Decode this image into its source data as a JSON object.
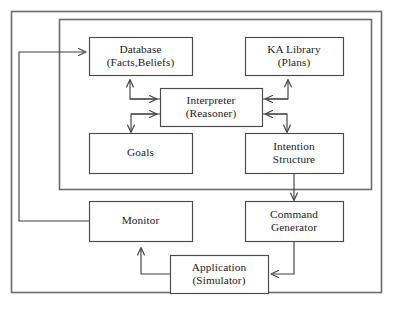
{
  "diagram": {
    "type": "block-diagram",
    "canvas": {
      "width": 394,
      "height": 312,
      "background": "#ffffff"
    },
    "colors": {
      "frame_stroke": "#6b6b6b",
      "box_stroke": "#4a4a4a",
      "connector_stroke": "#404040",
      "box_fill": "#ffffff",
      "text": "#1b1b1b"
    },
    "frames": [
      {
        "name": "outer-frame",
        "x": 11,
        "y": 11,
        "width": 371,
        "height": 282
      },
      {
        "name": "inner-frame",
        "x": 59,
        "y": 19,
        "width": 313,
        "height": 171
      }
    ],
    "nodes": [
      {
        "id": "database",
        "line1": "Database",
        "line2": "(Facts,Beliefs)",
        "x": 89,
        "y": 37,
        "width": 103,
        "height": 38
      },
      {
        "id": "ka-library",
        "line1": "KA Library",
        "line2": "(Plans)",
        "x": 245,
        "y": 37,
        "width": 98,
        "height": 38
      },
      {
        "id": "interpreter",
        "line1": "Interpreter",
        "line2": "(Reasoner)",
        "x": 160,
        "y": 88,
        "width": 102,
        "height": 38
      },
      {
        "id": "goals",
        "line1": "Goals",
        "line2": "",
        "x": 89,
        "y": 133,
        "width": 103,
        "height": 40
      },
      {
        "id": "intention-structure",
        "line1": "Intention",
        "line2": "Structure",
        "x": 245,
        "y": 133,
        "width": 98,
        "height": 40
      },
      {
        "id": "monitor",
        "line1": "Monitor",
        "line2": "",
        "x": 89,
        "y": 201,
        "width": 103,
        "height": 40
      },
      {
        "id": "command-generator",
        "line1": "Command",
        "line2": "Generator",
        "x": 245,
        "y": 201,
        "width": 98,
        "height": 40
      },
      {
        "id": "application",
        "line1": "Application",
        "line2": "(Simulator)",
        "x": 170,
        "y": 255,
        "width": 98,
        "height": 38
      }
    ],
    "edges": [
      {
        "id": "interpreter-to-database",
        "from": "interpreter",
        "to": "database",
        "direction": "up"
      },
      {
        "id": "database-to-interpreter",
        "from": "database",
        "to": "interpreter",
        "direction": "right"
      },
      {
        "id": "goals-to-interpreter",
        "from": "goals",
        "to": "interpreter",
        "direction": "right"
      },
      {
        "id": "interpreter-to-goals",
        "from": "interpreter",
        "to": "goals",
        "direction": "down"
      },
      {
        "id": "interpreter-to-ka-library",
        "from": "interpreter",
        "to": "ka-library",
        "direction": "up"
      },
      {
        "id": "ka-library-to-interpreter",
        "from": "ka-library",
        "to": "interpreter",
        "direction": "left"
      },
      {
        "id": "intention-to-interpreter",
        "from": "intention-structure",
        "to": "interpreter",
        "direction": "left"
      },
      {
        "id": "interpreter-to-intention",
        "from": "interpreter",
        "to": "intention-structure",
        "direction": "down"
      },
      {
        "id": "intention-to-command",
        "from": "intention-structure",
        "to": "command-generator",
        "direction": "down"
      },
      {
        "id": "command-to-application",
        "from": "command-generator",
        "to": "application",
        "direction": "left"
      },
      {
        "id": "application-to-monitor",
        "from": "application",
        "to": "monitor",
        "direction": "up"
      },
      {
        "id": "monitor-to-database",
        "from": "monitor",
        "to": "database",
        "direction": "right"
      }
    ]
  }
}
